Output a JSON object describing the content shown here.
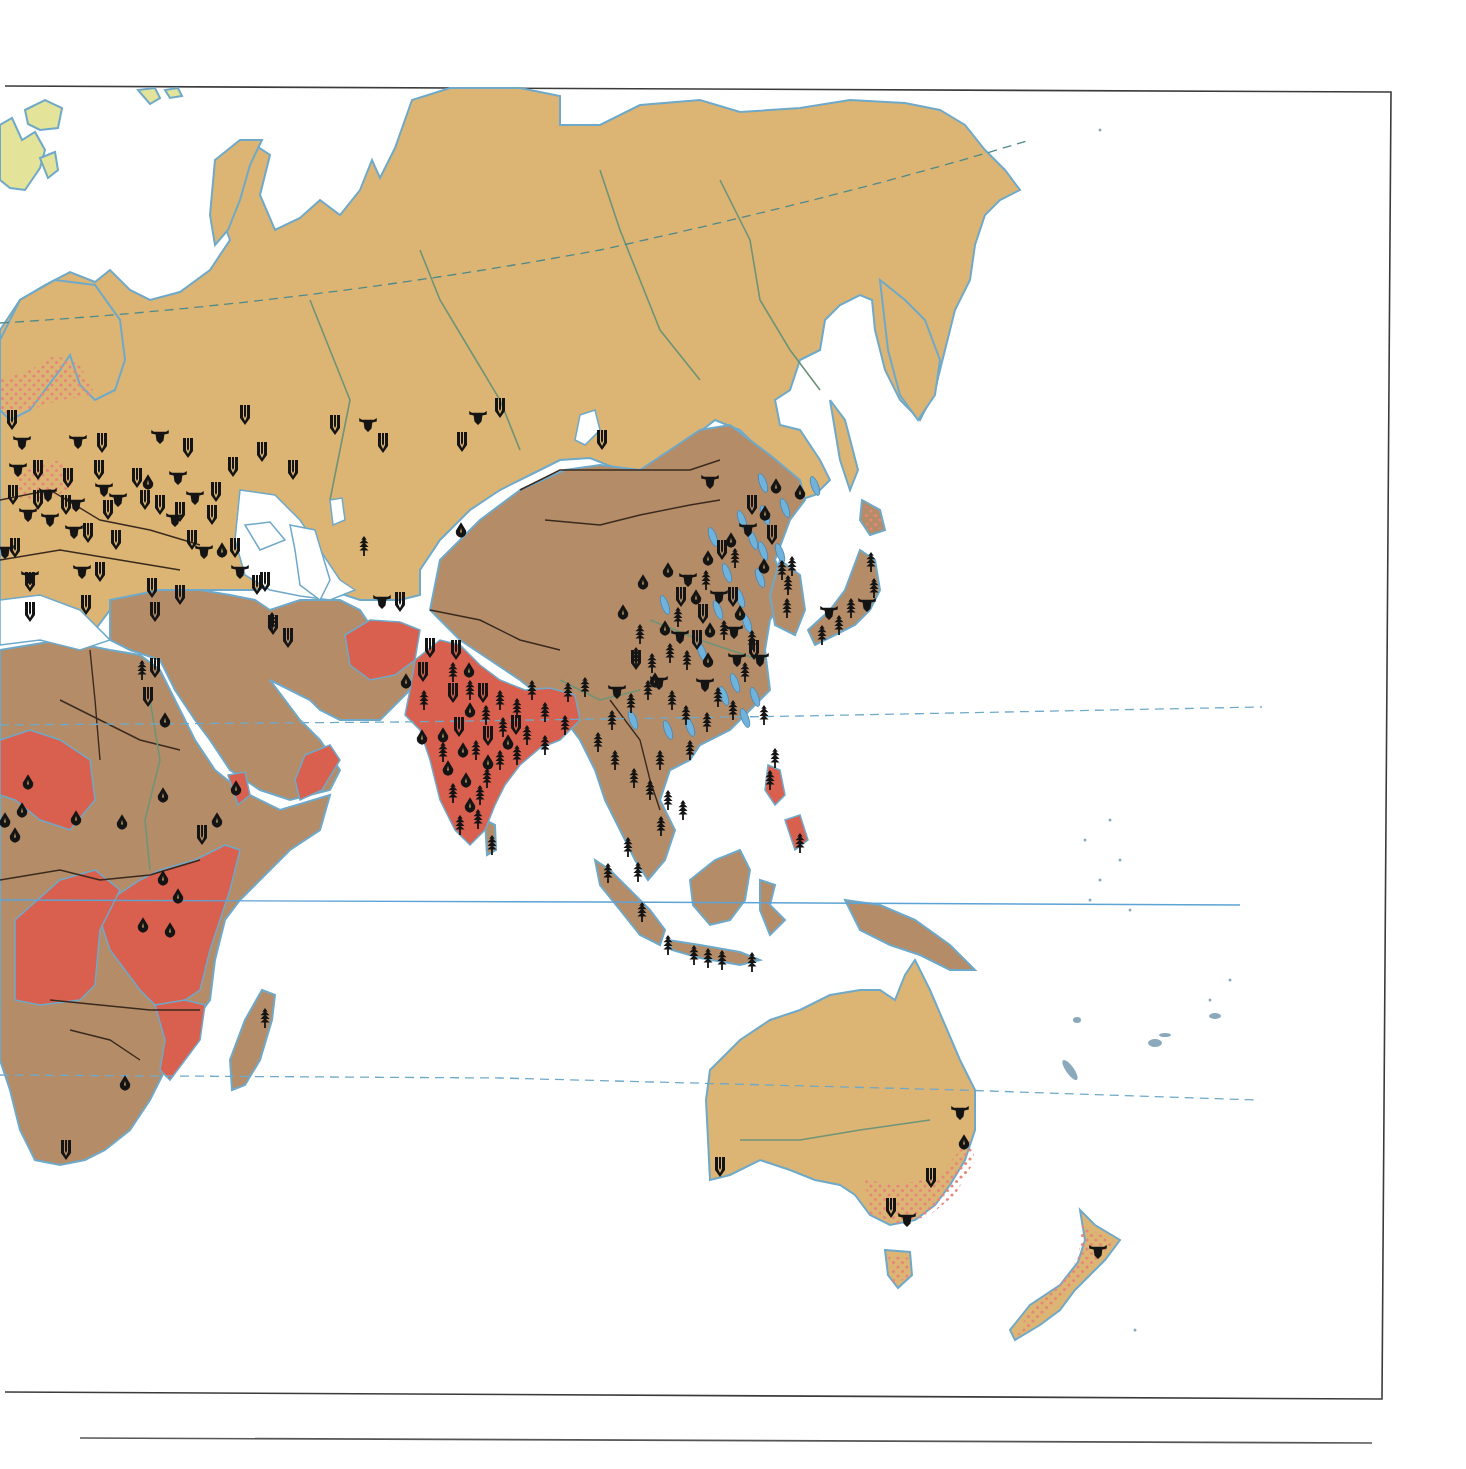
{
  "map": {
    "type": "thematic world map (Eastern Hemisphere)",
    "regions_visible": [
      "Europe",
      "Asia",
      "Africa",
      "Australia",
      "New Zealand",
      "Indonesia",
      "Pacific islands"
    ],
    "colors": {
      "class_tan": "#dcb574",
      "class_brown": "#b48c68",
      "class_red": "#d9604e",
      "class_arctic": "#e3e39a",
      "dot_pattern": "#e8857a",
      "coastline": "#6fa9c9",
      "river": "#6e9478",
      "border": "#3a2a1e",
      "symbol": "#141414",
      "fish_symbol": "#6fb2dc",
      "frame": "#3b3b3b"
    },
    "reference_lines": [
      {
        "name": "arctic-circle",
        "style": "dashed"
      },
      {
        "name": "tropic-of-cancer",
        "style": "dashed"
      },
      {
        "name": "equator",
        "style": "solid"
      },
      {
        "name": "tropic-of-capricorn",
        "style": "dashed"
      }
    ],
    "symbol_types": [
      {
        "id": "wheat",
        "icon": "wheat-icon"
      },
      {
        "id": "cattle",
        "icon": "cattle-icon"
      },
      {
        "id": "rice",
        "icon": "rice-icon"
      },
      {
        "id": "maize",
        "icon": "maize-icon"
      },
      {
        "id": "fish",
        "icon": "fish-icon"
      }
    ],
    "symbols": [
      {
        "t": "wheat",
        "x": 12,
        "y": 420
      },
      {
        "t": "cattle",
        "x": 22,
        "y": 443
      },
      {
        "t": "cattle",
        "x": 78,
        "y": 442
      },
      {
        "t": "wheat",
        "x": 102,
        "y": 443
      },
      {
        "t": "cattle",
        "x": 18,
        "y": 470
      },
      {
        "t": "wheat",
        "x": 38,
        "y": 470
      },
      {
        "t": "cattle",
        "x": 48,
        "y": 495
      },
      {
        "t": "wheat",
        "x": 68,
        "y": 478
      },
      {
        "t": "wheat",
        "x": 13,
        "y": 495
      },
      {
        "t": "wheat",
        "x": 38,
        "y": 500
      },
      {
        "t": "cattle",
        "x": 28,
        "y": 515
      },
      {
        "t": "cattle",
        "x": 50,
        "y": 520
      },
      {
        "t": "wheat",
        "x": 66,
        "y": 505
      },
      {
        "t": "cattle",
        "x": 76,
        "y": 505
      },
      {
        "t": "cattle",
        "x": 74,
        "y": 532
      },
      {
        "t": "wheat",
        "x": 88,
        "y": 533
      },
      {
        "t": "wheat",
        "x": 99,
        "y": 470
      },
      {
        "t": "cattle",
        "x": 104,
        "y": 490
      },
      {
        "t": "wheat",
        "x": 108,
        "y": 510
      },
      {
        "t": "wheat",
        "x": 116,
        "y": 540
      },
      {
        "t": "cattle",
        "x": 82,
        "y": 572
      },
      {
        "t": "wheat",
        "x": 100,
        "y": 572
      },
      {
        "t": "wheat",
        "x": 15,
        "y": 548
      },
      {
        "t": "cattle",
        "x": 5,
        "y": 552
      },
      {
        "t": "wheat",
        "x": 30,
        "y": 582
      },
      {
        "t": "cattle",
        "x": 30,
        "y": 578
      },
      {
        "t": "wheat",
        "x": 86,
        "y": 605
      },
      {
        "t": "wheat",
        "x": 30,
        "y": 612
      },
      {
        "t": "cattle",
        "x": 160,
        "y": 437
      },
      {
        "t": "wheat",
        "x": 188,
        "y": 448
      },
      {
        "t": "maize",
        "x": 148,
        "y": 482
      },
      {
        "t": "cattle",
        "x": 178,
        "y": 478
      },
      {
        "t": "wheat",
        "x": 137,
        "y": 478
      },
      {
        "t": "cattle",
        "x": 118,
        "y": 500
      },
      {
        "t": "wheat",
        "x": 145,
        "y": 500
      },
      {
        "t": "wheat",
        "x": 160,
        "y": 505
      },
      {
        "t": "cattle",
        "x": 195,
        "y": 498
      },
      {
        "t": "wheat",
        "x": 216,
        "y": 492
      },
      {
        "t": "wheat",
        "x": 245,
        "y": 415
      },
      {
        "t": "wheat",
        "x": 262,
        "y": 452
      },
      {
        "t": "wheat",
        "x": 233,
        "y": 467
      },
      {
        "t": "wheat",
        "x": 180,
        "y": 512
      },
      {
        "t": "cattle",
        "x": 175,
        "y": 520
      },
      {
        "t": "wheat",
        "x": 192,
        "y": 540
      },
      {
        "t": "wheat",
        "x": 212,
        "y": 515
      },
      {
        "t": "cattle",
        "x": 204,
        "y": 552
      },
      {
        "t": "maize",
        "x": 222,
        "y": 550
      },
      {
        "t": "wheat",
        "x": 235,
        "y": 548
      },
      {
        "t": "cattle",
        "x": 240,
        "y": 572
      },
      {
        "t": "wheat",
        "x": 257,
        "y": 585
      },
      {
        "t": "wheat",
        "x": 293,
        "y": 470
      },
      {
        "t": "wheat",
        "x": 152,
        "y": 588
      },
      {
        "t": "wheat",
        "x": 180,
        "y": 595
      },
      {
        "t": "wheat",
        "x": 155,
        "y": 612
      },
      {
        "t": "wheat",
        "x": 265,
        "y": 582
      },
      {
        "t": "wheat",
        "x": 335,
        "y": 425
      },
      {
        "t": "cattle",
        "x": 368,
        "y": 425
      },
      {
        "t": "wheat",
        "x": 383,
        "y": 443
      },
      {
        "t": "wheat",
        "x": 462,
        "y": 442
      },
      {
        "t": "cattle",
        "x": 478,
        "y": 418
      },
      {
        "t": "wheat",
        "x": 500,
        "y": 408
      },
      {
        "t": "wheat",
        "x": 602,
        "y": 440
      },
      {
        "t": "maize",
        "x": 461,
        "y": 530
      },
      {
        "t": "rice",
        "x": 364,
        "y": 546
      },
      {
        "t": "cattle",
        "x": 382,
        "y": 602
      },
      {
        "t": "wheat",
        "x": 400,
        "y": 602
      },
      {
        "t": "wheat",
        "x": 288,
        "y": 638
      },
      {
        "t": "wheat",
        "x": 273,
        "y": 625
      },
      {
        "t": "rice",
        "x": 272,
        "y": 622
      },
      {
        "t": "cattle",
        "x": 710,
        "y": 482
      },
      {
        "t": "maize",
        "x": 776,
        "y": 486
      },
      {
        "t": "maize",
        "x": 800,
        "y": 492
      },
      {
        "t": "wheat",
        "x": 752,
        "y": 505
      },
      {
        "t": "maize",
        "x": 765,
        "y": 513
      },
      {
        "t": "cattle",
        "x": 748,
        "y": 530
      },
      {
        "t": "wheat",
        "x": 772,
        "y": 535
      },
      {
        "t": "maize",
        "x": 731,
        "y": 540
      },
      {
        "t": "wheat",
        "x": 722,
        "y": 550
      },
      {
        "t": "rice",
        "x": 735,
        "y": 558
      },
      {
        "t": "maize",
        "x": 708,
        "y": 558
      },
      {
        "t": "maize",
        "x": 764,
        "y": 566
      },
      {
        "t": "rice",
        "x": 782,
        "y": 570
      },
      {
        "t": "maize",
        "x": 668,
        "y": 570
      },
      {
        "t": "cattle",
        "x": 688,
        "y": 580
      },
      {
        "t": "rice",
        "x": 706,
        "y": 580
      },
      {
        "t": "maize",
        "x": 643,
        "y": 582
      },
      {
        "t": "wheat",
        "x": 681,
        "y": 597
      },
      {
        "t": "maize",
        "x": 696,
        "y": 597
      },
      {
        "t": "cattle",
        "x": 719,
        "y": 597
      },
      {
        "t": "wheat",
        "x": 733,
        "y": 597
      },
      {
        "t": "maize",
        "x": 623,
        "y": 612
      },
      {
        "t": "wheat",
        "x": 703,
        "y": 614
      },
      {
        "t": "maize",
        "x": 740,
        "y": 613
      },
      {
        "t": "rice",
        "x": 678,
        "y": 617
      },
      {
        "t": "maize",
        "x": 665,
        "y": 628
      },
      {
        "t": "rice",
        "x": 640,
        "y": 634
      },
      {
        "t": "maize",
        "x": 710,
        "y": 630
      },
      {
        "t": "rice",
        "x": 724,
        "y": 630
      },
      {
        "t": "cattle",
        "x": 680,
        "y": 637
      },
      {
        "t": "wheat",
        "x": 697,
        "y": 640
      },
      {
        "t": "cattle",
        "x": 734,
        "y": 632
      },
      {
        "t": "rice",
        "x": 752,
        "y": 640
      },
      {
        "t": "wheat",
        "x": 754,
        "y": 650
      },
      {
        "t": "rice",
        "x": 636,
        "y": 657
      },
      {
        "t": "wheat",
        "x": 636,
        "y": 660
      },
      {
        "t": "rice",
        "x": 652,
        "y": 663
      },
      {
        "t": "rice",
        "x": 670,
        "y": 653
      },
      {
        "t": "rice",
        "x": 687,
        "y": 660
      },
      {
        "t": "maize",
        "x": 708,
        "y": 660
      },
      {
        "t": "cattle",
        "x": 737,
        "y": 660
      },
      {
        "t": "cattle",
        "x": 760,
        "y": 660
      },
      {
        "t": "rice",
        "x": 745,
        "y": 672
      },
      {
        "t": "maize",
        "x": 655,
        "y": 680
      },
      {
        "t": "cattle",
        "x": 617,
        "y": 692
      },
      {
        "t": "rice",
        "x": 631,
        "y": 703
      },
      {
        "t": "rice",
        "x": 648,
        "y": 690
      },
      {
        "t": "cattle",
        "x": 659,
        "y": 683
      },
      {
        "t": "rice",
        "x": 672,
        "y": 700
      },
      {
        "t": "cattle",
        "x": 705,
        "y": 685
      },
      {
        "t": "rice",
        "x": 718,
        "y": 697
      },
      {
        "t": "rice",
        "x": 733,
        "y": 710
      },
      {
        "t": "rice",
        "x": 686,
        "y": 715
      },
      {
        "t": "rice",
        "x": 707,
        "y": 722
      },
      {
        "t": "rice",
        "x": 764,
        "y": 715
      },
      {
        "t": "rice",
        "x": 690,
        "y": 750
      },
      {
        "t": "rice",
        "x": 612,
        "y": 720
      },
      {
        "t": "rice",
        "x": 598,
        "y": 742
      },
      {
        "t": "rice",
        "x": 615,
        "y": 760
      },
      {
        "t": "rice",
        "x": 634,
        "y": 778
      },
      {
        "t": "rice",
        "x": 660,
        "y": 760
      },
      {
        "t": "rice",
        "x": 650,
        "y": 790
      },
      {
        "t": "rice",
        "x": 668,
        "y": 800
      },
      {
        "t": "rice",
        "x": 683,
        "y": 810
      },
      {
        "t": "rice",
        "x": 661,
        "y": 826
      },
      {
        "t": "rice",
        "x": 628,
        "y": 847
      },
      {
        "t": "rice",
        "x": 638,
        "y": 872
      },
      {
        "t": "rice",
        "x": 608,
        "y": 873
      },
      {
        "t": "rice",
        "x": 642,
        "y": 912
      },
      {
        "t": "rice",
        "x": 668,
        "y": 945
      },
      {
        "t": "rice",
        "x": 694,
        "y": 955
      },
      {
        "t": "rice",
        "x": 708,
        "y": 958
      },
      {
        "t": "rice",
        "x": 722,
        "y": 960
      },
      {
        "t": "rice",
        "x": 752,
        "y": 962
      },
      {
        "t": "rice",
        "x": 770,
        "y": 780
      },
      {
        "t": "rice",
        "x": 800,
        "y": 843
      },
      {
        "t": "rice",
        "x": 775,
        "y": 758
      },
      {
        "t": "rice",
        "x": 792,
        "y": 566
      },
      {
        "t": "rice",
        "x": 788,
        "y": 585
      },
      {
        "t": "rice",
        "x": 787,
        "y": 608
      },
      {
        "t": "rice",
        "x": 871,
        "y": 562
      },
      {
        "t": "rice",
        "x": 874,
        "y": 588
      },
      {
        "t": "cattle",
        "x": 867,
        "y": 605
      },
      {
        "t": "rice",
        "x": 851,
        "y": 608
      },
      {
        "t": "cattle",
        "x": 829,
        "y": 613
      },
      {
        "t": "rice",
        "x": 839,
        "y": 625
      },
      {
        "t": "rice",
        "x": 822,
        "y": 635
      },
      {
        "t": "wheat",
        "x": 430,
        "y": 648
      },
      {
        "t": "wheat",
        "x": 456,
        "y": 650
      },
      {
        "t": "wheat",
        "x": 423,
        "y": 672
      },
      {
        "t": "maize",
        "x": 406,
        "y": 681
      },
      {
        "t": "rice",
        "x": 453,
        "y": 672
      },
      {
        "t": "maize",
        "x": 469,
        "y": 670
      },
      {
        "t": "wheat",
        "x": 453,
        "y": 693
      },
      {
        "t": "rice",
        "x": 470,
        "y": 690
      },
      {
        "t": "maize",
        "x": 470,
        "y": 710
      },
      {
        "t": "rice",
        "x": 486,
        "y": 715
      },
      {
        "t": "wheat",
        "x": 483,
        "y": 693
      },
      {
        "t": "rice",
        "x": 500,
        "y": 700
      },
      {
        "t": "rice",
        "x": 517,
        "y": 708
      },
      {
        "t": "rice",
        "x": 532,
        "y": 690
      },
      {
        "t": "rice",
        "x": 545,
        "y": 712
      },
      {
        "t": "rice",
        "x": 568,
        "y": 692
      },
      {
        "t": "rice",
        "x": 585,
        "y": 687
      },
      {
        "t": "rice",
        "x": 424,
        "y": 700
      },
      {
        "t": "maize",
        "x": 422,
        "y": 737
      },
      {
        "t": "maize",
        "x": 443,
        "y": 735
      },
      {
        "t": "wheat",
        "x": 459,
        "y": 727
      },
      {
        "t": "rice",
        "x": 503,
        "y": 727
      },
      {
        "t": "wheat",
        "x": 516,
        "y": 725
      },
      {
        "t": "rice",
        "x": 527,
        "y": 735
      },
      {
        "t": "wheat",
        "x": 488,
        "y": 736
      },
      {
        "t": "maize",
        "x": 508,
        "y": 742
      },
      {
        "t": "rice",
        "x": 443,
        "y": 752
      },
      {
        "t": "maize",
        "x": 463,
        "y": 750
      },
      {
        "t": "rice",
        "x": 476,
        "y": 750
      },
      {
        "t": "rice",
        "x": 517,
        "y": 755
      },
      {
        "t": "maize",
        "x": 488,
        "y": 762
      },
      {
        "t": "rice",
        "x": 500,
        "y": 760
      },
      {
        "t": "maize",
        "x": 448,
        "y": 768
      },
      {
        "t": "rice",
        "x": 487,
        "y": 778
      },
      {
        "t": "maize",
        "x": 466,
        "y": 780
      },
      {
        "t": "rice",
        "x": 453,
        "y": 793
      },
      {
        "t": "rice",
        "x": 480,
        "y": 795
      },
      {
        "t": "maize",
        "x": 470,
        "y": 805
      },
      {
        "t": "rice",
        "x": 478,
        "y": 819
      },
      {
        "t": "rice",
        "x": 460,
        "y": 825
      },
      {
        "t": "rice",
        "x": 492,
        "y": 845
      },
      {
        "t": "rice",
        "x": 545,
        "y": 745
      },
      {
        "t": "rice",
        "x": 565,
        "y": 725
      },
      {
        "t": "wheat",
        "x": 155,
        "y": 668
      },
      {
        "t": "rice",
        "x": 142,
        "y": 670
      },
      {
        "t": "wheat",
        "x": 148,
        "y": 697
      },
      {
        "t": "maize",
        "x": 165,
        "y": 720
      },
      {
        "t": "maize",
        "x": 28,
        "y": 782
      },
      {
        "t": "maize",
        "x": 76,
        "y": 818
      },
      {
        "t": "maize",
        "x": 22,
        "y": 810
      },
      {
        "t": "maize",
        "x": 15,
        "y": 835
      },
      {
        "t": "maize",
        "x": 5,
        "y": 820
      },
      {
        "t": "maize",
        "x": 122,
        "y": 822
      },
      {
        "t": "maize",
        "x": 163,
        "y": 795
      },
      {
        "t": "maize",
        "x": 217,
        "y": 820
      },
      {
        "t": "wheat",
        "x": 202,
        "y": 835
      },
      {
        "t": "maize",
        "x": 163,
        "y": 878
      },
      {
        "t": "maize",
        "x": 178,
        "y": 896
      },
      {
        "t": "maize",
        "x": 143,
        "y": 925
      },
      {
        "t": "maize",
        "x": 170,
        "y": 930
      },
      {
        "t": "maize",
        "x": 236,
        "y": 788
      },
      {
        "t": "maize",
        "x": 125,
        "y": 1083
      },
      {
        "t": "wheat",
        "x": 66,
        "y": 1150
      },
      {
        "t": "rice",
        "x": 265,
        "y": 1018
      },
      {
        "t": "cattle",
        "x": 960,
        "y": 1113
      },
      {
        "t": "maize",
        "x": 964,
        "y": 1142
      },
      {
        "t": "wheat",
        "x": 931,
        "y": 1178
      },
      {
        "t": "wheat",
        "x": 891,
        "y": 1208
      },
      {
        "t": "cattle",
        "x": 907,
        "y": 1220
      },
      {
        "t": "wheat",
        "x": 720,
        "y": 1167
      },
      {
        "t": "cattle",
        "x": 1098,
        "y": 1252
      }
    ],
    "fish_marks": [
      [
        763,
        483
      ],
      [
        765,
        515
      ],
      [
        785,
        508
      ],
      [
        742,
        520
      ],
      [
        753,
        540
      ],
      [
        727,
        573
      ],
      [
        763,
        551
      ],
      [
        780,
        553
      ],
      [
        713,
        537
      ],
      [
        740,
        598
      ],
      [
        718,
        610
      ],
      [
        760,
        578
      ],
      [
        747,
        623
      ],
      [
        702,
        652
      ],
      [
        735,
        683
      ],
      [
        724,
        696
      ],
      [
        755,
        697
      ],
      [
        745,
        718
      ],
      [
        668,
        730
      ],
      [
        690,
        727
      ],
      [
        665,
        605
      ],
      [
        633,
        720
      ],
      [
        815,
        486
      ]
    ]
  }
}
